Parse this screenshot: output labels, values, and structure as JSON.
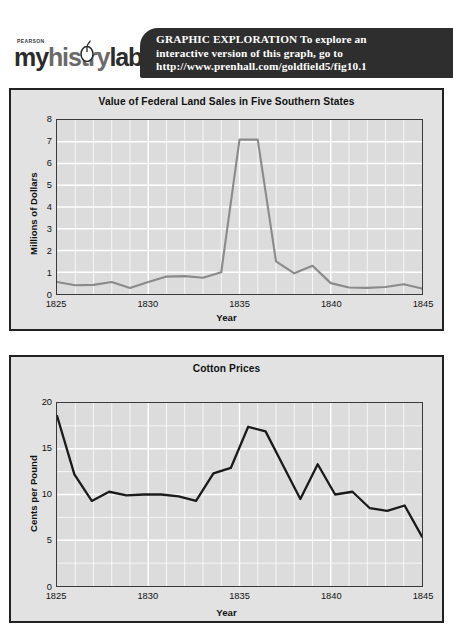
{
  "header": {
    "logo": {
      "brand_small": "PEARSON",
      "brand_part1": "my",
      "brand_part2": "hist",
      "brand_part3": "ry",
      "brand_part4": "lab",
      "trademark": "™",
      "mouse_icon_name": "computer-mouse-icon"
    },
    "banner": {
      "line1": "GRAPHIC  EXPLORATION  To explore an",
      "line2": "interactive version of this graph, go to",
      "line3": "http://www.prenhall.com/goldfield5/fig10.1",
      "background": "#2e2e2e",
      "text_color": "#ffffff"
    }
  },
  "colors": {
    "panel_background": "#e2e2e2",
    "plot_background": "#dcdcdc",
    "grid": "#ffffff",
    "panel_border": "#222222",
    "line_top": "#8a8a8a",
    "line_bottom": "#1a1a1a"
  },
  "chart_data": [
    {
      "type": "line",
      "title": "Value of Federal Land Sales in Five Southern States",
      "xlabel": "Year",
      "ylabel": "Millions of Dollars",
      "xlim": [
        1825,
        1845
      ],
      "ylim": [
        0,
        8
      ],
      "yticks": [
        0,
        1,
        2,
        3,
        4,
        5,
        6,
        7,
        8
      ],
      "xticks": [
        1825,
        1830,
        1835,
        1840,
        1845
      ],
      "grid": true,
      "line_color": "#8a8a8a",
      "x": [
        1825,
        1826,
        1827,
        1828,
        1829,
        1830,
        1831,
        1832,
        1833,
        1834,
        1835,
        1836,
        1837,
        1838,
        1839,
        1840,
        1841,
        1842,
        1843,
        1844,
        1845
      ],
      "values": [
        0.55,
        0.4,
        0.42,
        0.55,
        0.28,
        0.55,
        0.8,
        0.82,
        0.75,
        1.0,
        7.1,
        7.1,
        1.5,
        0.95,
        1.3,
        0.5,
        0.3,
        0.28,
        0.32,
        0.45,
        0.25
      ]
    },
    {
      "type": "line",
      "title": "Cotton Prices",
      "xlabel": "Year",
      "ylabel": "Cents per Pound",
      "xlim": [
        1825,
        1845
      ],
      "ylim": [
        0,
        20
      ],
      "yticks": [
        0,
        5,
        10,
        15,
        20
      ],
      "xticks": [
        1825,
        1830,
        1835,
        1840,
        1845
      ],
      "grid": true,
      "line_color": "#1a1a1a",
      "x": [
        1825,
        1826,
        1827,
        1828,
        1829,
        1830,
        1831,
        1832,
        1833,
        1834,
        1835,
        1836,
        1837,
        1838,
        1839,
        1840,
        1841,
        1842,
        1843,
        1844,
        1845
      ],
      "values": [
        18.6,
        12.2,
        9.3,
        10.3,
        9.9,
        10.0,
        10.0,
        9.8,
        9.3,
        12.3,
        12.9,
        17.4,
        16.9,
        13.2,
        9.5,
        13.3,
        10.0,
        10.3,
        8.5,
        8.2,
        8.8,
        5.4
      ]
    }
  ]
}
